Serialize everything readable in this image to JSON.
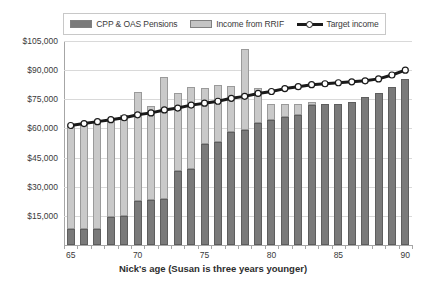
{
  "legend": {
    "position": "top",
    "entries": [
      {
        "label": "CPP & OAS Pensions",
        "icon": "dark-square-swatch",
        "color": "#7a7a7a"
      },
      {
        "label": "Income from RRIF",
        "icon": "light-square-swatch",
        "color": "#c9c9c9"
      },
      {
        "label": "Target income",
        "icon": "line-marker-swatch",
        "color": "#1a1a1a"
      }
    ]
  },
  "axes": {
    "x_title": "Nick's age (Susan is three years younger)",
    "y_ticks": [
      "$15,000",
      "$30,000",
      "$45,000",
      "$60,000",
      "$75,000",
      "$90,000",
      "$105,000"
    ],
    "x_ticks": [
      "65",
      "70",
      "75",
      "80",
      "85",
      "90"
    ]
  },
  "chart_data": {
    "type": "bar",
    "title": "",
    "subtitle": "",
    "xlabel": "Nick's age (Susan is three years younger)",
    "ylabel": "",
    "ylim": [
      0,
      105000
    ],
    "ytick_values": [
      0,
      15000,
      30000,
      45000,
      60000,
      75000,
      90000,
      105000
    ],
    "grid": true,
    "stacked": true,
    "legend_position": "top",
    "categories": [
      65,
      66,
      67,
      68,
      69,
      70,
      71,
      72,
      73,
      74,
      75,
      76,
      77,
      78,
      79,
      80,
      81,
      82,
      83,
      84,
      85,
      86,
      87,
      88,
      89,
      90
    ],
    "series": [
      {
        "name": "CPP & OAS Pensions",
        "color": "#7a7a7a",
        "values": [
          8000,
          8000,
          8200,
          14500,
          15000,
          22500,
          23000,
          23500,
          38000,
          39000,
          52000,
          53000,
          58000,
          59000,
          63000,
          64500,
          66000,
          67000,
          72000,
          72500,
          72500,
          73500,
          76000,
          78500,
          81500,
          85500
        ]
      },
      {
        "name": "Income from RRIF",
        "color": "#c9c9c9",
        "values": [
          53500,
          54500,
          55500,
          50500,
          52000,
          56500,
          48500,
          63000,
          40000,
          42500,
          29000,
          29500,
          24000,
          42000,
          18000,
          8000,
          6500,
          5500,
          1500,
          0,
          0,
          0,
          0,
          0,
          0,
          0
        ]
      }
    ],
    "bar_totals": [
      61500,
      62500,
      63700,
      65000,
      67000,
      79000,
      71500,
      86500,
      78000,
      81500,
      81000,
      82500,
      82000,
      101000,
      81000,
      72500,
      72500,
      72500,
      73500,
      72500,
      72500,
      73500,
      76000,
      78500,
      81500,
      85500
    ],
    "overlay_line": {
      "name": "Target income",
      "color": "#1a1a1a",
      "marker": "circle-open",
      "values": [
        61500,
        62500,
        63500,
        64500,
        65500,
        67000,
        68000,
        69500,
        70500,
        72000,
        73000,
        74000,
        75500,
        76500,
        78000,
        79000,
        80500,
        81500,
        82500,
        83000,
        83500,
        84000,
        84500,
        85500,
        87500,
        90000
      ]
    }
  }
}
